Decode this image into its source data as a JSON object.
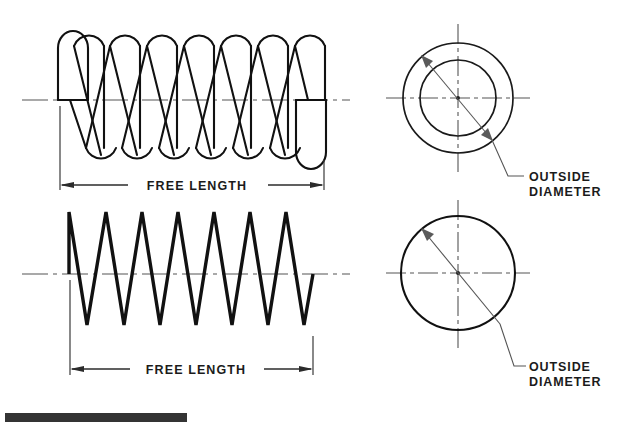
{
  "document": {
    "title": "Compression Spring Dimension Drawing",
    "background_color": "#ffffff",
    "line_color": "#111111",
    "centerline_color": "#555555",
    "text_color": "#1b1b1b"
  },
  "labels": {
    "free_length_top": "FREE LENGTH",
    "free_length_bottom": "FREE LENGTH",
    "outside_diameter_top_line1": "OUTSIDE",
    "outside_diameter_top_line2": "DIAMETER",
    "outside_diameter_bottom_line1": "OUTSIDE",
    "outside_diameter_bottom_line2": "DIAMETER"
  },
  "views": {
    "top_left": {
      "name": "helical-compression-spring-side-view",
      "style": "detailed-outline-helix",
      "centerline_y": 100,
      "coil_left_x": 55,
      "coil_right_x": 320,
      "coil_top_y": 30,
      "coil_bottom_y": 162,
      "coil_count": 7
    },
    "bottom_left": {
      "name": "compression-spring-schematic-side-view",
      "style": "zigzag-schematic",
      "centerline_y": 274,
      "coil_left_x": 67,
      "coil_right_x": 315,
      "peak_y": 212,
      "valley_y": 325,
      "coil_count": 7
    },
    "top_right": {
      "name": "spring-end-view-two-circles",
      "center_x": 458,
      "center_y": 98,
      "outer_radius": 55,
      "inner_radius": 38
    },
    "bottom_right": {
      "name": "spring-end-view-single-circle",
      "center_x": 458,
      "center_y": 273,
      "outer_radius": 57
    }
  },
  "footer": {
    "bar_label": "black-redaction-bar",
    "bar_color": "#343434",
    "bar_x": 5,
    "bar_y": 413,
    "bar_width": 182,
    "bar_height": 9
  }
}
